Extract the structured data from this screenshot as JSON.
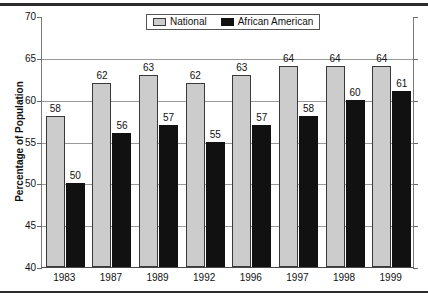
{
  "chart_data": {
    "type": "bar",
    "title": "",
    "xlabel": "",
    "ylabel": "Percentage of Population",
    "ylim": [
      40,
      70
    ],
    "ytick_step": 5,
    "yticks": [
      40,
      45,
      50,
      55,
      60,
      65,
      70
    ],
    "grid": true,
    "grid_axis": "y",
    "legend_position": "top-center",
    "categories": [
      "1983",
      "1987",
      "1989",
      "1992",
      "1996",
      "1997",
      "1998",
      "1999"
    ],
    "series": [
      {
        "name": "National",
        "color": "#cccccc",
        "values": [
          58,
          62,
          63,
          62,
          63,
          64,
          64,
          64
        ]
      },
      {
        "name": "African American",
        "color": "#111111",
        "values": [
          50,
          56,
          57,
          55,
          57,
          58,
          60,
          61
        ]
      }
    ]
  },
  "axis": {
    "y_title": "Percentage of Population",
    "y_ticks": [
      "70",
      "65",
      "60",
      "55",
      "50",
      "45",
      "40"
    ],
    "x_ticks": [
      "1983",
      "1987",
      "1989",
      "1992",
      "1996",
      "1997",
      "1998",
      "1999"
    ]
  },
  "legend": {
    "items": [
      {
        "label": "National",
        "swatch": "gray-swatch-icon"
      },
      {
        "label": "African American",
        "swatch": "black-swatch-icon"
      }
    ]
  },
  "bar_labels": {
    "national": [
      "58",
      "62",
      "63",
      "62",
      "63",
      "64",
      "64",
      "64"
    ],
    "african": [
      "50",
      "56",
      "57",
      "55",
      "57",
      "58",
      "60",
      "61"
    ]
  }
}
